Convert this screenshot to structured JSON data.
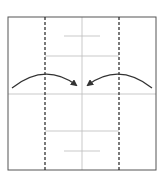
{
  "diagram": {
    "type": "origami-fold-step",
    "colors": {
      "background": "#ffffff",
      "paper_border": "#555555",
      "crease": "#bbbbbb",
      "fold_line": "#222222",
      "arrow": "#333333"
    },
    "square": {
      "x": 8,
      "y": 17,
      "w": 148,
      "h": 153
    },
    "fold_lines": [
      {
        "name": "left-valley-fold",
        "x": 45,
        "style": "dashed"
      },
      {
        "name": "right-valley-fold",
        "x": 119,
        "style": "dashed"
      }
    ],
    "creases": [
      {
        "name": "center-vertical",
        "x1": 82,
        "y1": 17,
        "x2": 82,
        "y2": 170
      },
      {
        "name": "center-horizontal",
        "x1": 8,
        "y1": 94,
        "x2": 156,
        "y2": 94
      },
      {
        "name": "upper-short",
        "x1": 64,
        "y1": 36,
        "x2": 100,
        "y2": 36
      },
      {
        "name": "upper-mid",
        "x1": 45,
        "y1": 56,
        "x2": 119,
        "y2": 56
      },
      {
        "name": "lower-mid",
        "x1": 45,
        "y1": 131,
        "x2": 119,
        "y2": 131
      },
      {
        "name": "lower-short",
        "x1": 64,
        "y1": 151,
        "x2": 100,
        "y2": 151
      }
    ],
    "arrows": [
      {
        "name": "left-fold-arrow",
        "direction": "right",
        "path": "M12 88 Q45 62 76 85"
      },
      {
        "name": "right-fold-arrow",
        "direction": "left",
        "path": "M152 88 Q119 62 88 85"
      }
    ]
  }
}
